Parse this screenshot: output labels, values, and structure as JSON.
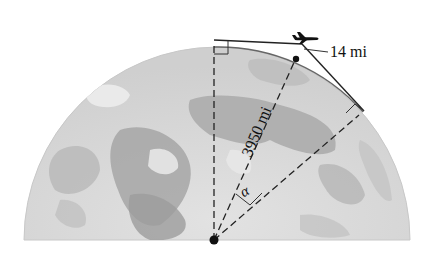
{
  "figure": {
    "labels": {
      "altitude": "14 mi",
      "radius": "3950 mi",
      "angle": "α"
    },
    "icons": {
      "airplane": "airplane-icon"
    },
    "colors": {
      "globe_light": "#d8d8d8",
      "globe_dark": "#9a9a9a",
      "lines": "#222222"
    }
  }
}
